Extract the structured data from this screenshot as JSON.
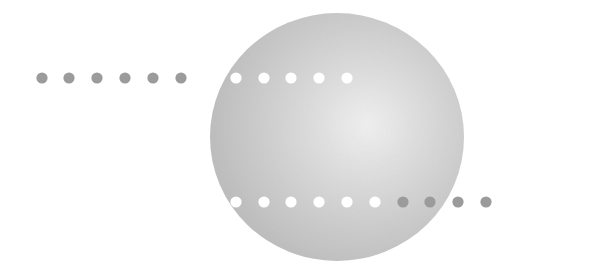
{
  "diagram": {
    "background": "#ffffff",
    "sphere": {
      "cx": 337,
      "cy": 137,
      "rx": 127,
      "ry": 124,
      "highlight_color": "#f2f2f2",
      "mid_color": "#d4d4d4",
      "edge_color": "#bdbdbd"
    },
    "dot_radius": 5.6,
    "colors": {
      "outside_dot": "#9b9b9b",
      "inside_dot": "#ffffff"
    },
    "rows": [
      {
        "name": "top-row",
        "y": 78,
        "dots": [
          {
            "x": 42,
            "kind": "outside"
          },
          {
            "x": 69,
            "kind": "outside"
          },
          {
            "x": 97,
            "kind": "outside"
          },
          {
            "x": 125,
            "kind": "outside"
          },
          {
            "x": 153,
            "kind": "outside"
          },
          {
            "x": 181,
            "kind": "outside"
          },
          {
            "x": 208,
            "kind": "inside"
          },
          {
            "x": 236,
            "kind": "inside"
          },
          {
            "x": 264,
            "kind": "inside"
          },
          {
            "x": 291,
            "kind": "inside"
          },
          {
            "x": 319,
            "kind": "inside"
          },
          {
            "x": 347,
            "kind": "inside"
          }
        ]
      },
      {
        "name": "bottom-row",
        "y": 202,
        "dots": [
          {
            "x": 236,
            "kind": "inside"
          },
          {
            "x": 264,
            "kind": "inside"
          },
          {
            "x": 291,
            "kind": "inside"
          },
          {
            "x": 319,
            "kind": "inside"
          },
          {
            "x": 347,
            "kind": "inside"
          },
          {
            "x": 375,
            "kind": "inside"
          },
          {
            "x": 403,
            "kind": "outside"
          },
          {
            "x": 430,
            "kind": "outside"
          },
          {
            "x": 458,
            "kind": "outside"
          },
          {
            "x": 486,
            "kind": "outside"
          }
        ]
      }
    ]
  }
}
